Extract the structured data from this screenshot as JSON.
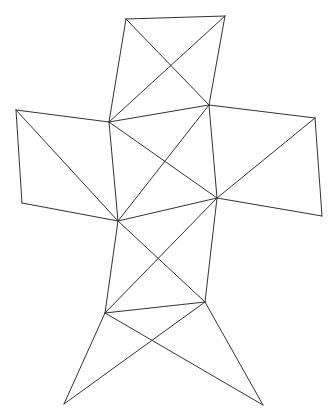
{
  "diagram": {
    "type": "polyhedron-net",
    "stroke_color": "#333333",
    "background": "#ffffff",
    "vertices": {
      "A": [
        126,
        19
      ],
      "B": [
        225,
        16
      ],
      "C": [
        109,
        122
      ],
      "D": [
        209,
        105
      ],
      "E": [
        16,
        110
      ],
      "F": [
        22,
        203
      ],
      "G": [
        315,
        118
      ],
      "H": [
        322,
        216
      ],
      "I": [
        118,
        221
      ],
      "J": [
        217,
        198
      ],
      "K": [
        105,
        313
      ],
      "L": [
        205,
        302
      ],
      "M": [
        64,
        404
      ],
      "N": [
        263,
        405
      ]
    },
    "edges": [
      [
        "A",
        "B"
      ],
      [
        "B",
        "D"
      ],
      [
        "D",
        "C"
      ],
      [
        "C",
        "A"
      ],
      [
        "A",
        "D"
      ],
      [
        "B",
        "C"
      ],
      [
        "E",
        "C"
      ],
      [
        "C",
        "I"
      ],
      [
        "I",
        "F"
      ],
      [
        "F",
        "E"
      ],
      [
        "E",
        "I"
      ],
      [
        "D",
        "G"
      ],
      [
        "G",
        "H"
      ],
      [
        "H",
        "J"
      ],
      [
        "J",
        "D"
      ],
      [
        "G",
        "J"
      ],
      [
        "C",
        "J"
      ],
      [
        "D",
        "I"
      ],
      [
        "I",
        "J"
      ],
      [
        "I",
        "K"
      ],
      [
        "J",
        "L"
      ],
      [
        "K",
        "L"
      ],
      [
        "I",
        "L"
      ],
      [
        "J",
        "K"
      ],
      [
        "K",
        "M"
      ],
      [
        "L",
        "M"
      ],
      [
        "K",
        "N"
      ],
      [
        "L",
        "N"
      ]
    ]
  }
}
